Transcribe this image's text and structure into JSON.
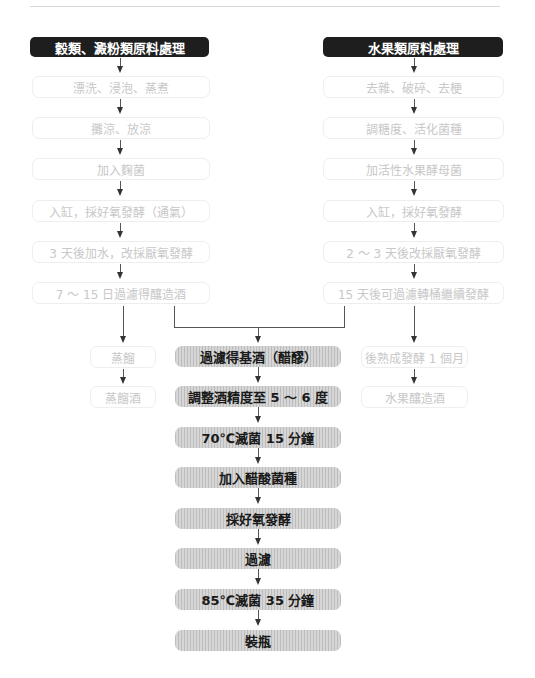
{
  "left_branch": {
    "header": "穀類、澱粉類原料處理",
    "steps": [
      "漂洗、浸泡、蒸煮",
      "攤涼、放涼",
      "加入麴菌",
      "入缸，採好氧發酵（通氣）",
      "3 天後加水，改採厭氧發酵",
      "7 ～ 15 日過濾得釀造酒"
    ],
    "side_steps": [
      "蒸餾",
      "蒸餾酒"
    ]
  },
  "right_branch": {
    "header": "水果類原料處理",
    "steps": [
      "去雜、破碎、去梗",
      "調糖度、活化菌種",
      "加活性水果酵母菌",
      "入缸，採好氧發酵",
      "2 ～ 3 天後改採厭氧發酵",
      "15 天後可過濾轉桶繼續發酵"
    ],
    "side_steps": [
      "後熟成發酵 1 個月",
      "水果釀造酒"
    ]
  },
  "main_flow": {
    "steps": [
      "過濾得基酒（醋醪）",
      "調整酒精度至 5 ～ 6 度",
      "70℃滅菌 15 分鐘",
      "加入醋酸菌種",
      "採好氧發酵",
      "過濾",
      "85℃滅菌 35 分鐘",
      "裝瓶"
    ]
  },
  "colors": {
    "header_bg": "#1e1e1e",
    "header_text": "#ffffff",
    "light_box_text": "#c8c8c8",
    "dark_box_bg": "#c9c9c9",
    "dark_box_text": "#1a1a1a",
    "connector": "#555555"
  }
}
